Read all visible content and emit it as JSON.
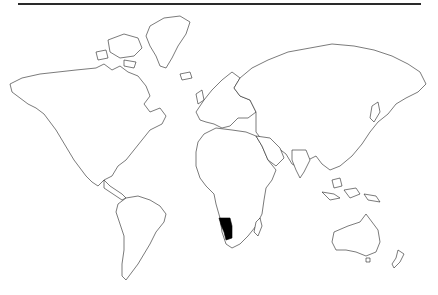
{
  "map": {
    "type": "world-outline",
    "projection": "miller",
    "highlighted_regions": [
      {
        "name": "Namibia",
        "fill": "#000000"
      }
    ],
    "land_fill": "#ffffff",
    "outline_color": "#222222",
    "background": "#ffffff",
    "top_rule_color": "#2a2a2a"
  }
}
